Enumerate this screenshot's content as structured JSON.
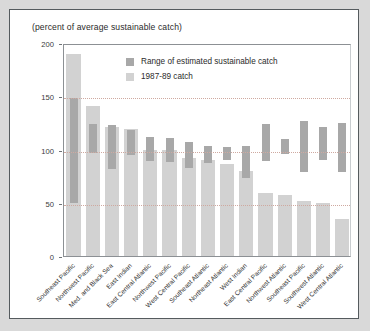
{
  "caption": "(percent of average sustainable catch)",
  "legend": [
    {
      "label": "Range of estimated sustainable catch",
      "color": "#a8a8a8"
    },
    {
      "label": "1987-89 catch",
      "color": "#d2d2d2"
    }
  ],
  "chart_data": {
    "type": "bar",
    "title": "",
    "subtitle": "(percent of average sustainable catch)",
    "xlabel": "",
    "ylabel": "(percent of average sustainable catch)",
    "ylim": [
      0,
      200
    ],
    "yticks": [
      0,
      50,
      100,
      150,
      200
    ],
    "grid": true,
    "legend_position": "top-center",
    "categories": [
      "Southeast Pacific",
      "Northwest Pacific",
      "Med. and Black Sea",
      "East Indian",
      "East Central Atlantic",
      "Northwest Pacific",
      "West Central Pacific",
      "Southeast Atlantic",
      "Northeast Atlantic",
      "West Indian",
      "East Central Pacific",
      "Northwest Atlantic",
      "Southeast Pacific",
      "Southwest Atlantic",
      "West Central Atlantic"
    ],
    "series": [
      {
        "name": "1987-89 catch",
        "color": "#d2d2d2",
        "values": [
          190,
          141,
          121,
          119,
          100,
          100,
          92,
          90,
          86,
          80,
          59,
          57,
          52,
          50,
          35
        ]
      },
      {
        "name": "Range of estimated sustainable catch",
        "color": "#a8a8a8",
        "ranges": [
          [
            50,
            148
          ],
          [
            97,
            124
          ],
          [
            82,
            123
          ],
          [
            95,
            118
          ],
          [
            89,
            112
          ],
          [
            88,
            111
          ],
          [
            83,
            107
          ],
          [
            87,
            103
          ],
          [
            90,
            102
          ],
          [
            73,
            103
          ],
          [
            89,
            124
          ],
          [
            96,
            110
          ],
          [
            79,
            127
          ],
          [
            90,
            121
          ],
          [
            79,
            125
          ]
        ]
      }
    ]
  }
}
